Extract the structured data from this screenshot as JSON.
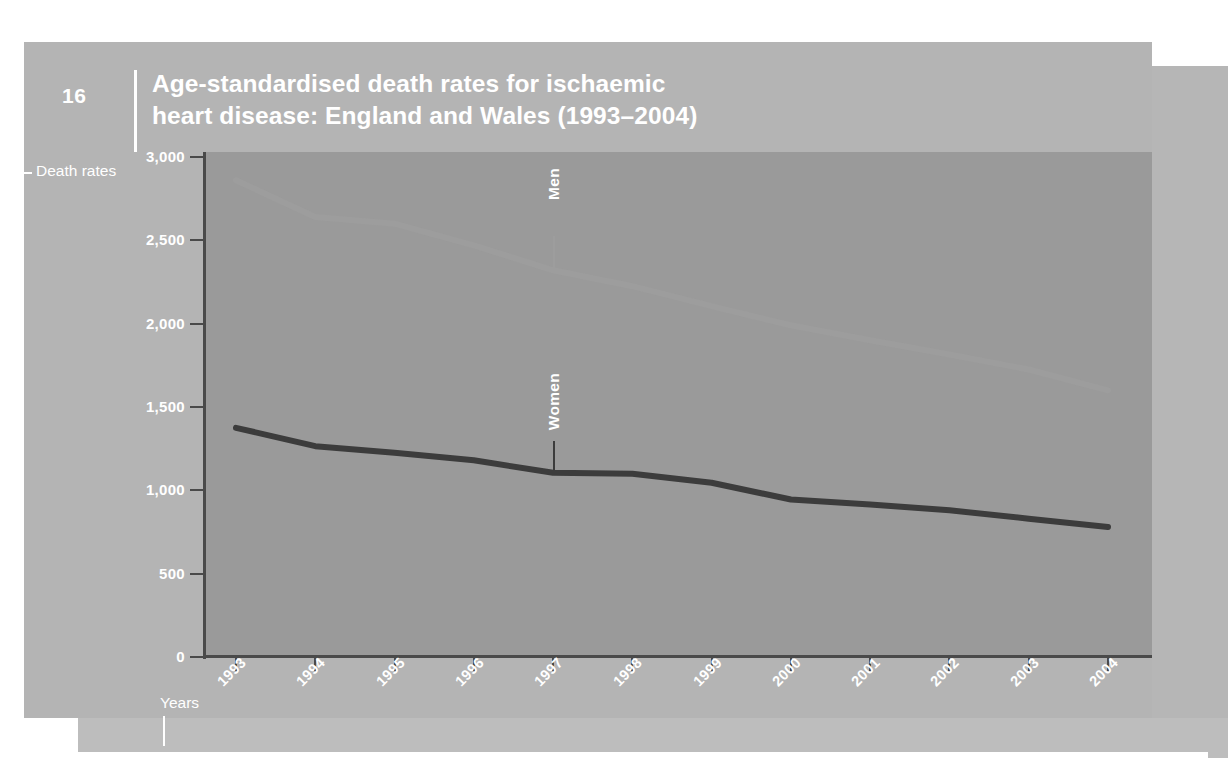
{
  "figure": {
    "number": "16",
    "title_line1": "Age-standardised death rates for ischaemic",
    "title_line2": "heart disease: England and Wales (1993–2004)",
    "title_full": "Age-standardised death rates for ischaemic heart disease: England and Wales (1993–2004)"
  },
  "axis_captions": {
    "y_caption": "Death rates",
    "x_caption": "Years"
  },
  "colors": {
    "page_background": "#ffffff",
    "panel_light": "#b4b4b4",
    "panel_mid": "#b6b6b6",
    "plot_background": "#9a9a9a",
    "axis": "#4a4a4a",
    "text_on_panel": "#ffffff",
    "men_line": "#9d9d9d",
    "women_line": "#3c3c3c"
  },
  "chart_data": {
    "type": "line",
    "title": "Age-standardised death rates for ischaemic heart disease: England and Wales (1993–2004)",
    "xlabel": "Years",
    "ylabel": "Death rates",
    "x": [
      1993,
      1994,
      1995,
      1996,
      1997,
      1998,
      1999,
      2000,
      2001,
      2002,
      2003,
      2004
    ],
    "categories": [
      "1993",
      "1994",
      "1995",
      "1996",
      "1997",
      "1998",
      "1999",
      "2000",
      "2001",
      "2002",
      "2003",
      "2004"
    ],
    "ylim": [
      0,
      3000
    ],
    "yticks": [
      0,
      500,
      1000,
      1500,
      2000,
      2500,
      3000
    ],
    "ytick_labels": [
      "0",
      "500",
      "1,000",
      "1,500",
      "2,000",
      "2,500",
      "3,000"
    ],
    "grid": false,
    "legend_position": "inline-annotation",
    "series": [
      {
        "name": "Men",
        "color": "#9d9d9d",
        "values": [
          2860,
          2640,
          2600,
          2470,
          2320,
          2225,
          2105,
          1990,
          1900,
          1815,
          1725,
          1600
        ]
      },
      {
        "name": "Women",
        "color": "#3c3c3c",
        "values": [
          1375,
          1265,
          1225,
          1180,
          1105,
          1100,
          1045,
          945,
          915,
          880,
          830,
          780
        ]
      }
    ],
    "annotations": [
      {
        "label": "Men",
        "series": "Men",
        "at_x": 1997
      },
      {
        "label": "Women",
        "series": "Women",
        "at_x": 1997
      }
    ]
  }
}
